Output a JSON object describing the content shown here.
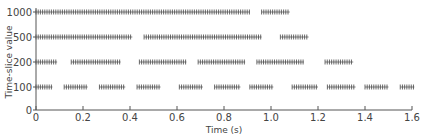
{
  "chart_data": {
    "type": "scatter",
    "title": "",
    "xlabel": "Time (s)",
    "ylabel": "Time-slice value",
    "xlim": [
      0,
      1.6
    ],
    "x_ticks": [
      0,
      0.2,
      0.4,
      0.6,
      0.8,
      1.0,
      1.2,
      1.4,
      1.6
    ],
    "x_tick_labels": [
      "0",
      "0.2",
      "0.4",
      "0.6",
      "0.8",
      "1.0",
      "1.2",
      "1.4",
      "1.6"
    ],
    "y_categories": [
      "0",
      "100",
      "200",
      "500",
      "1000"
    ],
    "grid": false,
    "legend": null,
    "marker": "+",
    "series": [
      {
        "name": "1000",
        "y": 1000,
        "segments": [
          [
            0.0,
            0.91
          ],
          [
            0.96,
            1.08
          ]
        ]
      },
      {
        "name": "500",
        "y": 500,
        "segments": [
          [
            0.0,
            0.41
          ],
          [
            0.46,
            0.96
          ],
          [
            1.04,
            1.16
          ]
        ]
      },
      {
        "name": "200",
        "y": 200,
        "segments": [
          [
            0.0,
            0.09
          ],
          [
            0.15,
            0.36
          ],
          [
            0.44,
            0.64
          ],
          [
            0.69,
            0.89
          ],
          [
            0.94,
            1.14
          ],
          [
            1.23,
            1.35
          ]
        ]
      },
      {
        "name": "100",
        "y": 100,
        "segments": [
          [
            0.0,
            0.07
          ],
          [
            0.12,
            0.22
          ],
          [
            0.27,
            0.38
          ],
          [
            0.43,
            0.53
          ],
          [
            0.61,
            0.71
          ],
          [
            0.76,
            0.87
          ],
          [
            0.91,
            1.01
          ],
          [
            1.09,
            1.2
          ],
          [
            1.24,
            1.36
          ],
          [
            1.4,
            1.5
          ],
          [
            1.55,
            1.61
          ]
        ]
      }
    ]
  },
  "axis": {
    "xlabel": "Time (s)",
    "ylabel": "Time-slice value"
  }
}
